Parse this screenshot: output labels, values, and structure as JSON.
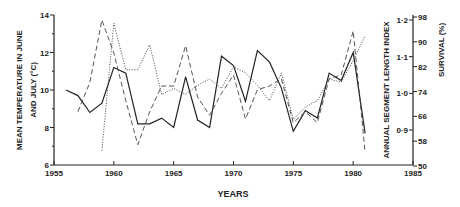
{
  "chart_data": {
    "type": "line",
    "title": "",
    "xlabel": "YEARS",
    "ylabel_left": "MEAN TEMPERATURE IN JUNE AND JULY (°C)",
    "ylabel_left_line1": "MEAN TEMPERATURE IN JUNE",
    "ylabel_left_line2": "AND JULY (°C)",
    "ylabel_right_inner": "ANNUAL SEGMENT LENGTH INDEX",
    "ylabel_right_outer": "SURVIVAL (%)",
    "xlim": [
      1955,
      1985
    ],
    "ylim_left": [
      6,
      14
    ],
    "x_ticks": [
      "1955",
      "1960",
      "1965",
      "1970",
      "1975",
      "1980",
      "1985"
    ],
    "y_ticks_left": [
      "6",
      "8",
      "10",
      "12",
      "14"
    ],
    "y_ticks_right_index": [
      "0·9",
      "1·0",
      "1·1",
      "1·2"
    ],
    "y_ticks_right_survival": [
      "50",
      "58",
      "66",
      "74",
      "82",
      "90",
      "98"
    ],
    "grid": false,
    "legend": "none",
    "series": [
      {
        "name": "Mean temperature June-July (°C)",
        "style": "solid",
        "axis": "left",
        "x": [
          1956,
          1957,
          1958,
          1959,
          1960,
          1961,
          1962,
          1963,
          1964,
          1965,
          1966,
          1967,
          1968,
          1969,
          1970,
          1971,
          1972,
          1973,
          1974,
          1975,
          1976,
          1977,
          1978,
          1979,
          1980,
          1981
        ],
        "values": [
          10.0,
          9.7,
          8.8,
          9.3,
          11.2,
          10.9,
          8.2,
          8.2,
          8.5,
          8.0,
          10.7,
          8.4,
          8.0,
          11.8,
          11.3,
          9.4,
          12.1,
          11.5,
          10.1,
          7.8,
          8.9,
          8.5,
          10.9,
          10.5,
          12.0,
          7.7
        ]
      },
      {
        "name": "Annual segment length index",
        "style": "dashed",
        "axis": "right-index",
        "x": [
          1957,
          1958,
          1959,
          1960,
          1961,
          1962,
          1963,
          1964,
          1965,
          1966,
          1967,
          1968,
          1969,
          1970,
          1971,
          1972,
          1973,
          1974,
          1975,
          1976,
          1977,
          1978,
          1979,
          1980,
          1981
        ],
        "values": [
          0.95,
          1.03,
          1.2,
          1.11,
          0.98,
          0.86,
          0.95,
          1.02,
          1.02,
          1.13,
          0.99,
          0.94,
          1.0,
          1.05,
          0.93,
          1.01,
          1.02,
          1.04,
          0.92,
          0.95,
          0.92,
          1.04,
          1.05,
          1.17,
          0.84
        ]
      },
      {
        "name": "Survival (%)",
        "style": "dotted",
        "axis": "right-survival",
        "x": [
          1959,
          1960,
          1961,
          1962,
          1963,
          1964,
          1965,
          1966,
          1967,
          1968,
          1969,
          1970,
          1971,
          1972,
          1973,
          1974,
          1975,
          1976,
          1977,
          1978,
          1979,
          1980,
          1981
        ],
        "values": [
          55,
          96,
          81,
          81,
          89,
          73,
          75,
          73,
          76,
          78,
          75,
          82,
          80,
          76,
          71,
          80,
          65,
          69,
          71,
          78,
          77,
          84,
          92
        ]
      }
    ]
  }
}
